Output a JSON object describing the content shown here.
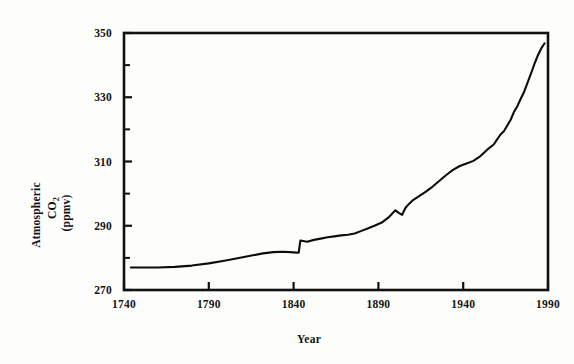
{
  "chart_data": {
    "type": "line",
    "title": "",
    "xlabel": "Year",
    "ylabel": "Atmospheric CO2 (ppmv)",
    "ylabel_parts": {
      "line1": "Atmospheric",
      "line2_main": "CO",
      "line2_sub": "2",
      "line3": "(ppmv)"
    },
    "xlim": [
      1740,
      1990
    ],
    "ylim": [
      270,
      350
    ],
    "xticks": [
      1740,
      1790,
      1840,
      1890,
      1940,
      1990
    ],
    "yticks": [
      270,
      290,
      310,
      330,
      350
    ],
    "y_minor_ticks": [
      280,
      300,
      320,
      340
    ],
    "grid": false,
    "legend": null,
    "series": [
      {
        "name": "Atmospheric CO2",
        "x": [
          1744,
          1760,
          1770,
          1780,
          1790,
          1800,
          1810,
          1816,
          1822,
          1828,
          1834,
          1840,
          1843,
          1844,
          1848,
          1852,
          1856,
          1860,
          1864,
          1868,
          1872,
          1876,
          1880,
          1884,
          1888,
          1892,
          1896,
          1900,
          1902,
          1904,
          1906,
          1908,
          1910,
          1914,
          1918,
          1922,
          1926,
          1930,
          1934,
          1938,
          1942,
          1946,
          1950,
          1954,
          1958,
          1960,
          1962,
          1964,
          1966,
          1968,
          1970,
          1972,
          1974,
          1976,
          1978,
          1980,
          1982,
          1984,
          1986,
          1988
        ],
        "y": [
          277.0,
          277.0,
          277.2,
          277.6,
          278.3,
          279.2,
          280.2,
          280.8,
          281.4,
          281.8,
          281.9,
          281.7,
          281.6,
          285.4,
          285.0,
          285.6,
          286.0,
          286.4,
          286.7,
          287.0,
          287.2,
          287.6,
          288.4,
          289.2,
          290.1,
          291.0,
          292.6,
          294.8,
          294.0,
          293.4,
          295.6,
          296.8,
          297.8,
          299.2,
          300.6,
          302.2,
          304.0,
          305.8,
          307.4,
          308.6,
          309.4,
          310.2,
          311.6,
          313.6,
          315.3,
          316.9,
          318.4,
          319.4,
          321.2,
          323.0,
          325.5,
          327.3,
          329.6,
          331.8,
          334.6,
          337.4,
          340.4,
          343.0,
          345.2,
          346.8
        ]
      }
    ]
  },
  "axis_labels": {
    "x_title": "Year"
  }
}
